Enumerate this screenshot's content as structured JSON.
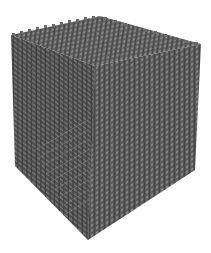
{
  "image": {
    "subject": "3D lattice cube",
    "description": "Gray grid-of-struts cubic lattice rendered in perspective on a white background",
    "background_color": "#ffffff",
    "colors": {
      "top_face": "#6e6e6e",
      "left_face": "#595959",
      "right_face": "#626262",
      "strut_highlight": "#9a9a9a",
      "strut_shadow": "#3e3e3e"
    },
    "grid_divisions": 20
  }
}
